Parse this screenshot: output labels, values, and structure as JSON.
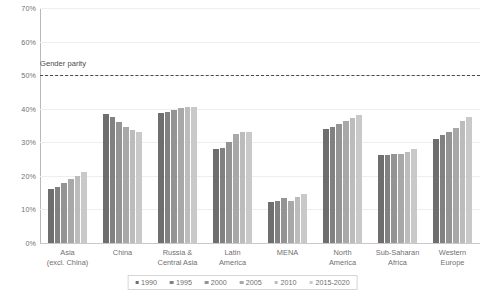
{
  "chart_data": {
    "type": "bar",
    "title": "",
    "subtitle": "",
    "xlabel": "",
    "ylabel": "",
    "ylim": [
      0,
      70
    ],
    "ytick_labels": [
      "0%",
      "10%",
      "20%",
      "30%",
      "40%",
      "50%",
      "60%",
      "70%"
    ],
    "ytick_values": [
      0,
      10,
      20,
      30,
      40,
      50,
      60,
      70
    ],
    "grid": true,
    "legend_position": "bottom",
    "categories": [
      "Asia\n(excl. China)",
      "China",
      "Russia &\nCentral Asia",
      "Latin\nAmerica",
      "MENA",
      "North\nAmerica",
      "Sub-Saharan\nAfrica",
      "Western\nEurope"
    ],
    "category_lines": [
      [
        "Asia",
        "(excl. China)"
      ],
      [
        "China",
        ""
      ],
      [
        "Russia &",
        "Central Asia"
      ],
      [
        "Latin",
        "America"
      ],
      [
        "MENA",
        ""
      ],
      [
        "North",
        "America"
      ],
      [
        "Sub-Saharan",
        "Africa"
      ],
      [
        "Western",
        "Europe"
      ]
    ],
    "series": [
      {
        "name": "1990",
        "color": "#6e6e6e",
        "values": [
          16.2,
          38.5,
          38.8,
          28.0,
          12.3,
          34.0,
          26.2,
          31.0
        ]
      },
      {
        "name": "1995",
        "color": "#818181",
        "values": [
          16.8,
          37.5,
          39.0,
          28.4,
          12.4,
          34.6,
          26.3,
          32.1
        ]
      },
      {
        "name": "2000",
        "color": "#949494",
        "values": [
          18.0,
          36.0,
          39.7,
          30.2,
          13.4,
          35.4,
          26.5,
          33.2
        ]
      },
      {
        "name": "2005",
        "color": "#a8a8a8",
        "values": [
          19.0,
          34.6,
          40.3,
          32.4,
          12.6,
          36.4,
          26.6,
          34.4
        ]
      },
      {
        "name": "2010",
        "color": "#bcbcbc",
        "values": [
          20.1,
          33.6,
          40.6,
          33.2,
          13.6,
          37.3,
          27.0,
          36.3
        ]
      },
      {
        "name": "2015-2020",
        "color": "#c9c9c9",
        "values": [
          21.2,
          33.1,
          40.4,
          33.0,
          14.6,
          38.1,
          27.9,
          37.5
        ]
      }
    ],
    "reference_line": {
      "label": "Gender parity",
      "value": 50,
      "style": "dashed",
      "color": "#4a4a4a"
    }
  }
}
